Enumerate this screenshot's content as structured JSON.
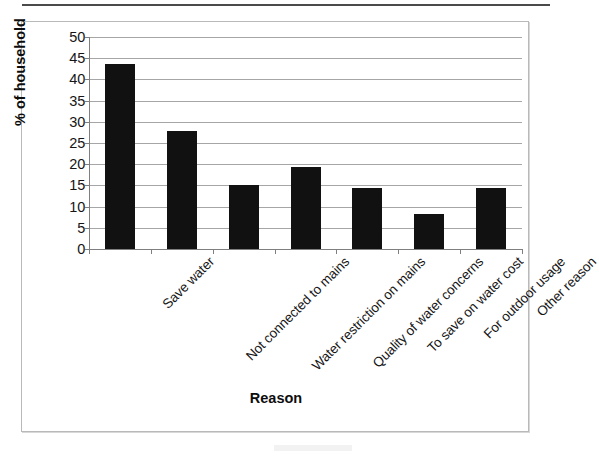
{
  "chart_data": {
    "type": "bar",
    "title": "",
    "xlabel": "Reason",
    "ylabel": "% of household",
    "categories": [
      "Save water",
      "Not connected to mains",
      "Water restriction on mains",
      "Quality of water concerns",
      "To save on water cost",
      "For outdoor usage",
      "Other reason"
    ],
    "values": [
      43.7,
      27.9,
      15.0,
      19.3,
      14.3,
      8.3,
      14.3
    ],
    "ylim": [
      0,
      50
    ],
    "ytick_labels": [
      "0",
      "5",
      "10",
      "15",
      "20",
      "25",
      "30",
      "35",
      "40",
      "45",
      "50"
    ],
    "ytick_values": [
      0,
      5,
      10,
      15,
      20,
      25,
      30,
      35,
      40,
      45,
      50
    ],
    "grid": true,
    "legend": false,
    "bar_color": "#111111",
    "gridline_color": "#a6a6a6",
    "axis_color": "#7f7f7f",
    "frame_color": "#b9b9b9",
    "background": "#ffffff"
  }
}
